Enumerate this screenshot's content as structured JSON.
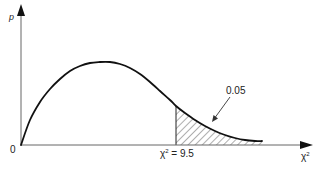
{
  "chart_data": {
    "type": "line",
    "title": "",
    "xlabel": "χ²",
    "ylabel": "p",
    "origin_label": "0",
    "grid": false,
    "legend": null,
    "critical_value": {
      "label_symbol": "χ",
      "label_superscript": "2",
      "label_rest": " = 9.5",
      "value": 9.5
    },
    "shaded_region": {
      "from": 9.5,
      "to": "tail end",
      "area": 0.05,
      "label": "0.05",
      "pattern": "diagonal hatching"
    },
    "curve_points_px": [
      [
        21,
        145
      ],
      [
        30,
        120
      ],
      [
        40,
        102
      ],
      [
        50,
        89
      ],
      [
        60,
        79
      ],
      [
        70,
        71
      ],
      [
        80,
        66
      ],
      [
        90,
        63
      ],
      [
        100,
        62
      ],
      [
        110,
        62
      ],
      [
        120,
        64
      ],
      [
        130,
        68
      ],
      [
        140,
        74
      ],
      [
        150,
        82
      ],
      [
        160,
        91
      ],
      [
        170,
        100
      ],
      [
        176,
        106
      ],
      [
        185,
        113
      ],
      [
        195,
        120
      ],
      [
        205,
        126
      ],
      [
        215,
        131
      ],
      [
        225,
        135
      ],
      [
        235,
        138
      ],
      [
        245,
        140
      ],
      [
        255,
        141
      ],
      [
        262,
        141
      ]
    ],
    "colors": {
      "curve": "#111111",
      "axes": "#555555",
      "hatch": "#333333",
      "background": "#ffffff"
    }
  }
}
